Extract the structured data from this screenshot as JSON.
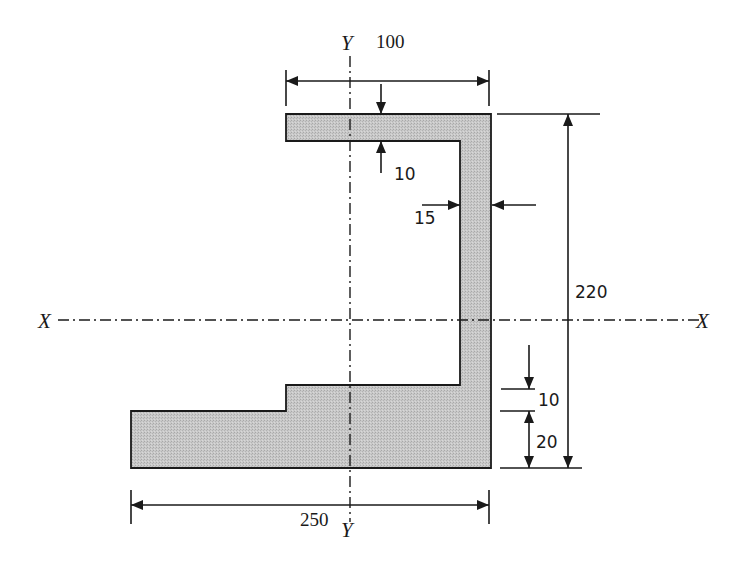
{
  "figure": {
    "section_fill_color": "#c8c8c8",
    "outline_color": "#1a1a1a",
    "axes": {
      "x_axis_left_label": "X",
      "x_axis_right_label": "X",
      "y_axis_top_label": "Y",
      "y_axis_bottom_label": "Y"
    },
    "dimensions": {
      "top_flange_width": "100",
      "top_flange_thickness": "10",
      "web_thickness": "15",
      "overall_height": "220",
      "step_height": "10",
      "bottom_flange_thickness": "20",
      "bottom_flange_width": "250"
    }
  }
}
